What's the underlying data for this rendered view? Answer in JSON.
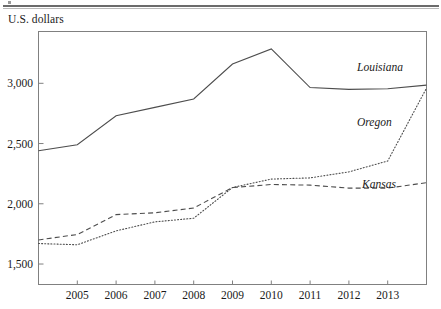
{
  "figure": {
    "y_axis_title": "U.S. dollars",
    "rule_color": "#6b6b6b",
    "frame_color": "#808080",
    "line_color": "#4d4d4d",
    "text_color": "#1a1a1a"
  },
  "y_ticks": [
    {
      "label": "3,000",
      "value": 3000
    },
    {
      "label": "2,500",
      "value": 2500
    },
    {
      "label": "2,000",
      "value": 2000
    },
    {
      "label": "1,500",
      "value": 1500
    }
  ],
  "x_ticks": [
    {
      "label": "2005",
      "value": 2005
    },
    {
      "label": "2006",
      "value": 2006
    },
    {
      "label": "2007",
      "value": 2007
    },
    {
      "label": "2008",
      "value": 2008
    },
    {
      "label": "2009",
      "value": 2009
    },
    {
      "label": "2010",
      "value": 2010
    },
    {
      "label": "2011",
      "value": 2011
    },
    {
      "label": "2012",
      "value": 2012
    },
    {
      "label": "2013",
      "value": 2013
    }
  ],
  "series_labels": {
    "louisiana": "Louisiana",
    "oregon": "Oregon",
    "kansas": "Kansas"
  },
  "chart_data": {
    "type": "line",
    "title": "",
    "subtitle": "",
    "xlabel": "",
    "ylabel": "U.S. dollars",
    "xlim": [
      2004,
      2014
    ],
    "ylim": [
      1330,
      3430
    ],
    "grid": false,
    "legend_position": "inline-right",
    "x": [
      2004,
      2005,
      2006,
      2007,
      2008,
      2009,
      2010,
      2011,
      2012,
      2013,
      2014
    ],
    "series": [
      {
        "name": "Louisiana",
        "style": "solid",
        "values": [
          2440,
          2490,
          2730,
          2800,
          2870,
          3160,
          3285,
          2965,
          2950,
          2955,
          2985
        ]
      },
      {
        "name": "Oregon",
        "style": "dotted",
        "values": [
          1670,
          1660,
          1775,
          1850,
          1880,
          2135,
          2205,
          2215,
          2265,
          2355,
          2960
        ]
      },
      {
        "name": "Kansas",
        "style": "dashed",
        "values": [
          1700,
          1745,
          1910,
          1925,
          1965,
          2135,
          2160,
          2155,
          2130,
          2130,
          2175
        ]
      }
    ]
  }
}
